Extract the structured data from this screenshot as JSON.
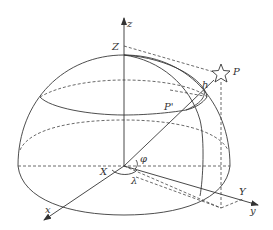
{
  "figure": {
    "type": "celestial-hemisphere-horizon-coordinates",
    "labels": {
      "z_axis": "z",
      "zenith": "Z",
      "star": "P",
      "altitude": "h",
      "projection": "P'",
      "azimuth_angle": "φ",
      "longitude_angle": "λ",
      "x_axis": "x",
      "x_point": "X",
      "y_axis": "y",
      "y_point": "Y"
    },
    "colors": {
      "line": "#3a3a3a",
      "text": "#333333",
      "background": "#ffffff"
    }
  }
}
